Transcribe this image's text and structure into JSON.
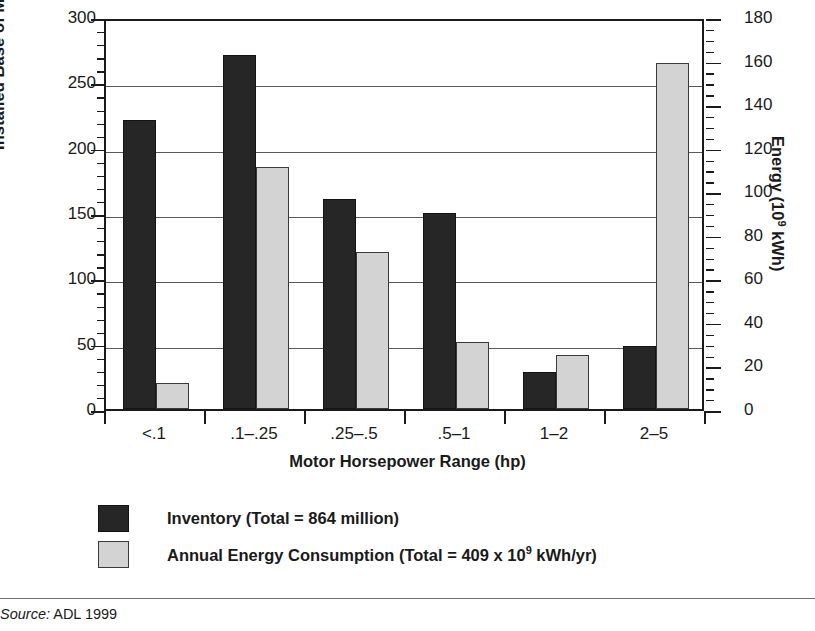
{
  "axes": {
    "y_left_title": "Installed Base of Motors (millions)",
    "y_right_title_pre": "Energy (10",
    "y_right_title_sup": "9",
    "y_right_title_post": " kWh)",
    "x_title": "Motor Horsepower Range (hp)",
    "y_left_ticks": [
      "300",
      "250",
      "200",
      "150",
      "100",
      "50",
      "0"
    ],
    "y_right_ticks": [
      "180",
      "160",
      "140",
      "120",
      "100",
      "80",
      "60",
      "40",
      "20",
      "0"
    ]
  },
  "legend": {
    "items": [
      {
        "swatch": "dark",
        "label": "Inventory (Total = 864 million)"
      },
      {
        "swatch": "light",
        "label_pre": "Annual Energy Consumption (Total = 409 x 10",
        "label_sup": "9",
        "label_post": " kWh/yr)"
      }
    ]
  },
  "source": {
    "word": "Source:",
    "value": " ADL 1999"
  },
  "colors": {
    "inventory_bar": "#262626",
    "energy_bar": "#d3d3d3",
    "axis": "#1a1a1a",
    "gridline": "#5a5a5a"
  },
  "chart_data": {
    "type": "bar",
    "title": "",
    "categories": [
      "<.1",
      ".1–.25",
      ".25–.5",
      ".5–1",
      "1–2",
      "2–5"
    ],
    "series": [
      {
        "name": "Inventory (Total = 864 million)",
        "axis": "left",
        "unit": "millions of motors",
        "values": [
          221,
          271,
          161,
          150,
          28,
          48
        ]
      },
      {
        "name": "Annual Energy Consumption (Total = 409 x 10^9 kWh/yr)",
        "axis": "right",
        "unit": "10^9 kWh",
        "values": [
          12,
          111,
          72,
          31,
          25,
          159
        ]
      }
    ],
    "xlabel": "Motor Horsepower Range (hp)",
    "ylabel": "Installed Base of Motors (millions)",
    "ylabel_right": "Energy (10^9 kWh)",
    "ylim": [
      0,
      300
    ],
    "ylim_right": [
      0,
      180
    ],
    "y_major_step": 50,
    "y_right_major_step": 20,
    "grid": true,
    "legend_position": "below-plot"
  }
}
